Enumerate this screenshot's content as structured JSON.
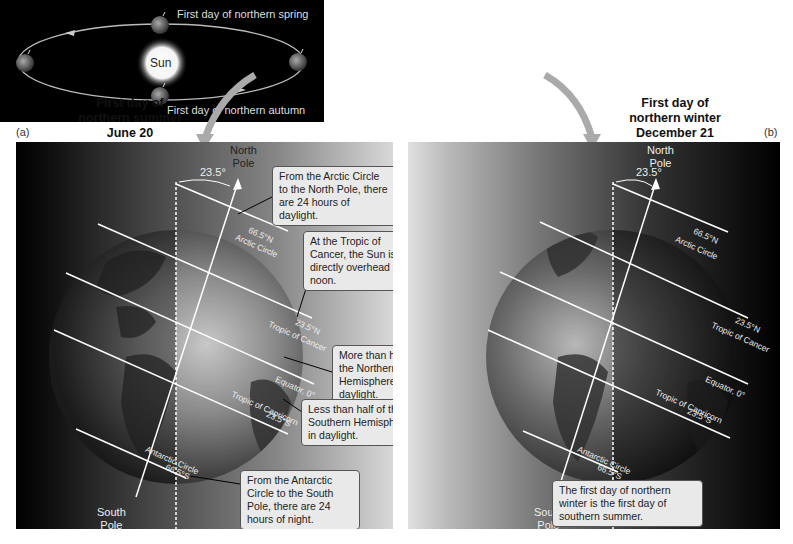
{
  "orbit": {
    "sun_label": "Sun",
    "spring_label": "First day of northern spring",
    "autumn_label": "First day of northern autumn"
  },
  "panel_a": {
    "letter": "(a)",
    "title_line1": "First day of",
    "title_line2": "northern summer",
    "title_line3": "June 20",
    "angle": "23.5°",
    "north_pole_line1": "North",
    "north_pole_line2": "Pole",
    "south_pole_line1": "South",
    "south_pole_line2": "Pole",
    "latitudes": {
      "arctic_deg": "66.5°N",
      "arctic_name": "Arctic Circle",
      "cancer_deg": "23.5°N",
      "cancer_name": "Tropic of Cancer",
      "equator": "Equator, 0°",
      "capricorn_name": "Tropic of Capricorn",
      "capricorn_deg": "23.5°S",
      "antarctic_name": "Antarctic Circle",
      "antarctic_deg": "66.5°S"
    },
    "callouts": [
      {
        "text": "From the Arctic Circle to the North Pole, there are 24 hours of daylight."
      },
      {
        "text": "At the Tropic of Cancer, the Sun is directly overhead at noon."
      },
      {
        "text": "More than half of the Northern Hemisphere is in daylight."
      },
      {
        "text": "Less than half of the Southern Hemisphere is in daylight."
      },
      {
        "text": "From the Antarctic Circle to the South Pole, there are 24 hours of night."
      }
    ]
  },
  "panel_b": {
    "letter": "(b)",
    "title_line1": "First day of",
    "title_line2": "northern winter",
    "title_line3": "December 21",
    "angle": "23.5°",
    "north_pole_line1": "North",
    "north_pole_line2": "Pole",
    "south_pole_line1": "South",
    "south_pole_line2": "Pole",
    "latitudes": {
      "arctic_deg": "66.5°N",
      "arctic_name": "Arctic Circle",
      "cancer_deg": "23.5°N",
      "cancer_name": "Tropic of Cancer",
      "equator": "Equator, 0°",
      "capricorn_name": "Tropic of Capricorn",
      "capricorn_deg": "23.5°S",
      "antarctic_name": "Antarctic Circle",
      "antarctic_deg": "66.5°S"
    },
    "callouts": [
      {
        "text": "The first day of northern winter is the first day of southern summer."
      }
    ]
  }
}
